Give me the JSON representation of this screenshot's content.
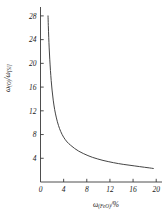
{
  "chart_data": {
    "type": "line",
    "title": "",
    "subtitle": "",
    "xlabel_parts": {
      "omega": "ω",
      "sub": "(FeO)",
      "unit": "/%"
    },
    "ylabel_parts": {
      "omega1": "ω",
      "sub1": "(O)",
      "slash": "/",
      "omega2": "ω",
      "sub2": "[Si]"
    },
    "xlabel": "ω(FeO)/%",
    "ylabel": "ω(O)/ω[Si]",
    "xlim": [
      0,
      21
    ],
    "ylim": [
      0,
      29.5
    ],
    "xticks": [
      0,
      4,
      8,
      12,
      16,
      20
    ],
    "xtick_labels": [
      "0",
      "4",
      "8",
      "12",
      "16",
      "20"
    ],
    "yticks": [
      4,
      8,
      12,
      16,
      20,
      24,
      28
    ],
    "ytick_labels": [
      "4",
      "8",
      "12",
      "16",
      "20",
      "24",
      "28"
    ],
    "grid": false,
    "legend": null,
    "axis_style": "open-L",
    "tick_direction": "in",
    "line_color": "#3a3a3a",
    "series": [
      {
        "name": "oxygen-to-silicon ratio",
        "x": [
          1.3,
          1.35,
          1.42,
          1.5,
          1.6,
          1.72,
          1.85,
          2.0,
          2.2,
          2.45,
          2.75,
          3.1,
          3.5,
          4.0,
          4.6,
          5.2,
          5.9,
          6.6,
          7.4,
          8.2,
          9.0,
          9.9,
          10.8,
          11.7,
          12.6,
          13.5,
          14.4,
          15.3,
          16.2,
          17.1,
          18.0,
          18.8,
          19.5
        ],
        "y": [
          28.0,
          26.4,
          24.4,
          22.6,
          20.7,
          18.8,
          17.1,
          15.5,
          13.8,
          12.2,
          10.8,
          9.55,
          8.5,
          7.55,
          6.75,
          6.2,
          5.65,
          5.2,
          4.8,
          4.45,
          4.15,
          3.88,
          3.64,
          3.44,
          3.26,
          3.1,
          2.96,
          2.84,
          2.72,
          2.6,
          2.48,
          2.38,
          2.28
        ]
      }
    ]
  }
}
